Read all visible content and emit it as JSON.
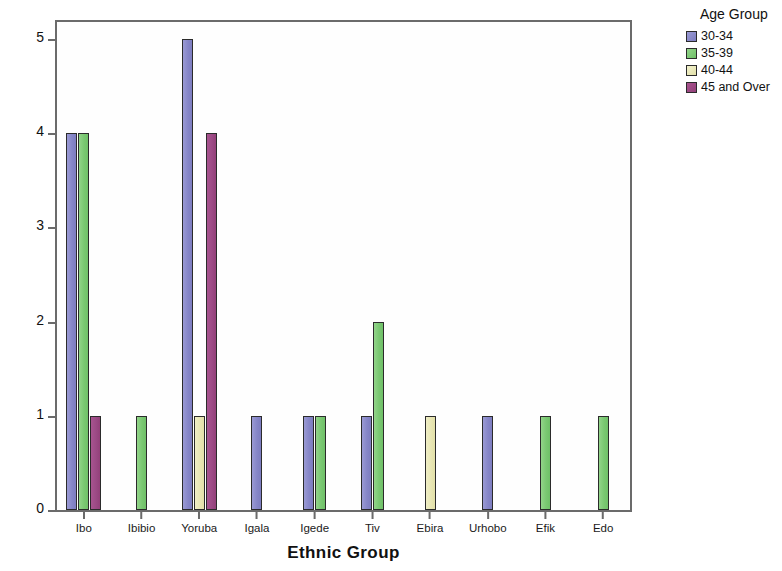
{
  "chart_data": {
    "type": "bar",
    "title": "",
    "xlabel": "Ethnic Group",
    "ylabel": "Count",
    "ylim": [
      0,
      5.2
    ],
    "yticks": [
      0,
      1,
      2,
      3,
      4,
      5
    ],
    "ytick_labels": [
      "0",
      "1",
      "2",
      "3",
      "4",
      "5"
    ],
    "grid": false,
    "legend_position": "right",
    "legend_title": "Age Group",
    "categories": [
      "Ibo",
      "Ibibio",
      "Yoruba",
      "Igala",
      "Igede",
      "Tiv",
      "Ebira",
      "Urhobo",
      "Efik",
      "Edo"
    ],
    "series": [
      {
        "name": "30-34",
        "color": "#8686c8",
        "values": [
          4,
          0,
          5,
          1,
          1,
          1,
          0,
          1,
          0,
          0
        ]
      },
      {
        "name": "35-39",
        "color": "#7ac872",
        "values": [
          4,
          1,
          0,
          0,
          1,
          2,
          0,
          0,
          1,
          1
        ]
      },
      {
        "name": "40-44",
        "color": "#e8e6b4",
        "values": [
          0,
          0,
          1,
          0,
          0,
          0,
          1,
          0,
          0,
          0
        ]
      },
      {
        "name": "45 and Over",
        "color": "#9c4a85",
        "values": [
          1,
          0,
          4,
          0,
          0,
          0,
          0,
          0,
          0,
          0
        ]
      }
    ]
  },
  "axes": {
    "y_title": "Count",
    "x_title": "Ethnic Group"
  },
  "legend": {
    "title": "Age Group",
    "items": [
      {
        "label": "30-34",
        "color": "#8686c8"
      },
      {
        "label": "35-39",
        "color": "#7ac872"
      },
      {
        "label": "40-44",
        "color": "#e8e6b4"
      },
      {
        "label": "45 and Over",
        "color": "#9c4a85"
      }
    ]
  },
  "colors": {
    "series_30_34": "#8686c8",
    "series_35_39": "#7ac872",
    "series_40_44": "#e8e6b4",
    "series_45_over": "#9c4a85",
    "axis": "#6b6b6b",
    "text": "#111111",
    "background": "#ffffff"
  }
}
